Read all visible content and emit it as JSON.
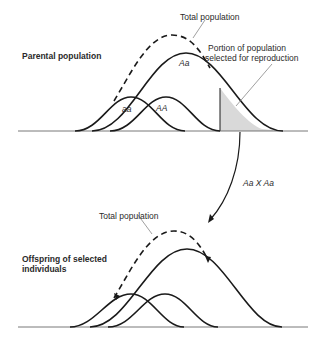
{
  "top_panel": {
    "title": "Parental population",
    "total_label": "Total population",
    "selected_label_line1": "Portion of population",
    "selected_label_line2": "selected for reproduction",
    "genotypes": {
      "aa": "aa",
      "AA": "AA",
      "Aa": "Aa"
    }
  },
  "cross": {
    "label": "Aa X Aa"
  },
  "bottom_panel": {
    "title_line1": "Offspring of selected",
    "title_line2": "individuals",
    "total_label": "Total population"
  },
  "colors": {
    "line": "#1a1a1a",
    "shade": "#d9d9d9",
    "leader": "#777777"
  }
}
